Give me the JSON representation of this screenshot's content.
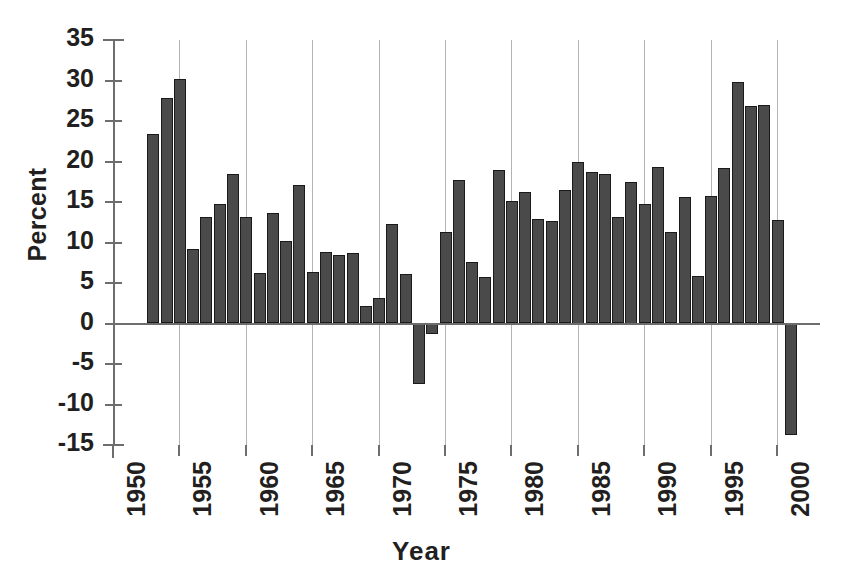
{
  "chart_data": {
    "type": "bar",
    "title": "",
    "xlabel": "Year",
    "ylabel": "Percent",
    "ylim": [
      -15,
      35
    ],
    "ytick_step": 5,
    "yticks": [
      35,
      30,
      25,
      20,
      15,
      10,
      5,
      0,
      -5,
      -10,
      -15
    ],
    "ytick_labels": [
      "35",
      "30",
      "25",
      "20",
      "15",
      "10",
      "5",
      "0",
      "-5",
      "-10",
      "-15"
    ],
    "xlim": [
      1950,
      2002
    ],
    "xticks": [
      1950,
      1955,
      1960,
      1965,
      1970,
      1975,
      1980,
      1985,
      1990,
      1995,
      2000
    ],
    "xtick_labels": [
      "1950",
      "1955",
      "1960",
      "1965",
      "1970",
      "1975",
      "1980",
      "1985",
      "1990",
      "1995",
      "2000"
    ],
    "grid": "vertical-only",
    "legend": "none",
    "bar_color": "#4a4a4a",
    "bar_edge_color": "#1a1a1a",
    "axis_color": "#6d6d6d",
    "gridline_color": "#b3b3b3",
    "text_color": "#231f20",
    "categories": [
      1953,
      1954,
      1955,
      1956,
      1957,
      1958,
      1959,
      1960,
      1961,
      1962,
      1963,
      1964,
      1965,
      1966,
      1967,
      1968,
      1969,
      1970,
      1971,
      1972,
      1973,
      1974,
      1975,
      1976,
      1977,
      1978,
      1979,
      1980,
      1981,
      1982,
      1983,
      1984,
      1985,
      1986,
      1987,
      1988,
      1989,
      1990,
      1991,
      1992,
      1993,
      1994,
      1995,
      1996,
      1997,
      1998,
      1999,
      2000,
      2001
    ],
    "values": [
      23.4,
      27.8,
      30.2,
      9.2,
      13.1,
      14.8,
      18.5,
      13.1,
      6.2,
      13.6,
      10.2,
      17.1,
      6.3,
      8.8,
      8.4,
      8.7,
      2.2,
      3.1,
      12.3,
      6.1,
      -7.5,
      -1.3,
      11.3,
      17.7,
      7.6,
      5.8,
      19.0,
      15.1,
      16.2,
      12.9,
      12.6,
      16.5,
      20.0,
      18.7,
      18.4,
      13.2,
      17.5,
      14.8,
      19.3,
      11.3,
      15.6,
      5.9,
      15.8,
      19.2,
      29.8,
      26.8,
      27.0,
      12.8,
      -13.8
    ]
  }
}
